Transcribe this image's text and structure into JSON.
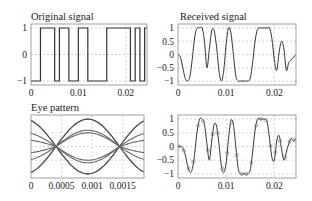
{
  "figure": {
    "width": 312,
    "height": 201,
    "background": "#ffffff",
    "axis_color": "#888888",
    "grid_color": "#bbbbbb",
    "line_color": "#333333",
    "eye_colors": [
      "#444444",
      "#666666",
      "#999999"
    ]
  },
  "chart_data": [
    {
      "id": "original",
      "type": "line",
      "title": "Original signal",
      "xlabel": "",
      "ylabel": "",
      "xlim": [
        0,
        0.0245
      ],
      "ylim": [
        -1.15,
        1.15
      ],
      "xticks": [
        0,
        0.01,
        0.02
      ],
      "xtick_labels": [
        "0",
        "0.01",
        "0.02"
      ],
      "yticks": [
        -1,
        0,
        1
      ],
      "ytick_labels": [
        "−1",
        "0",
        "1"
      ],
      "grid": true,
      "box": {
        "x": 31,
        "y": 24,
        "w": 116,
        "h": 61
      },
      "style": "step",
      "bit_period": 0.001,
      "bits": [
        -1,
        -1,
        1,
        1,
        1,
        -1,
        1,
        1,
        -1,
        -1,
        1,
        1,
        -1,
        -1,
        -1,
        -1,
        1,
        1,
        1,
        1,
        1,
        -1,
        1,
        -1,
        1
      ]
    },
    {
      "id": "received",
      "type": "line",
      "title": "Received signal",
      "xlabel": "",
      "ylabel": "",
      "xlim": [
        0,
        0.0245
      ],
      "ylim": [
        -1.15,
        1.15
      ],
      "xticks": [
        0,
        0.01,
        0.02
      ],
      "xtick_labels": [
        "0",
        "0.01",
        "0.02"
      ],
      "yticks": [
        -1,
        -0.5,
        0,
        0.5,
        1
      ],
      "ytick_labels": [
        "−1",
        "−0.5",
        "0",
        "0.5",
        "1"
      ],
      "grid": true,
      "box": {
        "x": 178,
        "y": 24,
        "w": 118,
        "h": 61
      },
      "style": "smooth",
      "x": [
        0,
        0.0005,
        0.001,
        0.0015,
        0.002,
        0.0025,
        0.003,
        0.0035,
        0.004,
        0.0045,
        0.005,
        0.0055,
        0.006,
        0.0065,
        0.007,
        0.0075,
        0.008,
        0.0085,
        0.009,
        0.0095,
        0.01,
        0.0105,
        0.011,
        0.0115,
        0.012,
        0.0125,
        0.013,
        0.0135,
        0.014,
        0.0145,
        0.015,
        0.0155,
        0.016,
        0.0165,
        0.017,
        0.0175,
        0.018,
        0.0185,
        0.019,
        0.0195,
        0.02,
        0.0205,
        0.021,
        0.0215,
        0.022,
        0.0225,
        0.023,
        0.0235,
        0.024,
        0.0245
      ],
      "y": [
        0,
        -0.1,
        -0.5,
        -0.9,
        -1,
        -0.8,
        -0.1,
        0.7,
        1,
        1,
        1,
        0.5,
        -0.5,
        0.2,
        0.9,
        0.9,
        0.3,
        -0.6,
        -1,
        -0.6,
        0.4,
        1,
        0.8,
        0,
        -0.8,
        -1,
        -1,
        -1,
        -1,
        -1,
        -0.9,
        -0.3,
        0.5,
        0.95,
        1,
        1,
        1,
        1,
        1,
        0.6,
        -0.2,
        -0.6,
        0.1,
        0.5,
        0.2,
        -0.6,
        -0.3,
        -0.2,
        -0.1,
        0
      ]
    },
    {
      "id": "eye",
      "type": "line",
      "title": "Eye pattern",
      "xlabel": "",
      "ylabel": "",
      "xlim": [
        0,
        0.00185
      ],
      "ylim": [
        -1.15,
        1.15
      ],
      "xticks": [
        0,
        0.0005,
        0.001,
        0.0015
      ],
      "xtick_labels": [
        "0",
        "0.0005",
        "0.001",
        "0.0015"
      ],
      "yticks": [],
      "ytick_labels": [],
      "grid": true,
      "box": {
        "x": 31,
        "y": 115,
        "w": 113,
        "h": 63
      },
      "crossings": [
        0.00041,
        0.00145
      ],
      "traces": [
        {
          "shape": "cos",
          "amp": 1.0,
          "phase": 0,
          "color_index": 2
        },
        {
          "shape": "cos",
          "amp": -1.0,
          "phase": 0,
          "color_index": 2
        },
        {
          "shape": "sin",
          "amp": 1.0,
          "phase": 0,
          "color_index": 0
        },
        {
          "shape": "sin",
          "amp": -1.0,
          "phase": 0,
          "color_index": 0
        },
        {
          "shape": "sin",
          "amp": 0.5,
          "phase": 0,
          "color_index": 1
        },
        {
          "shape": "sin",
          "amp": -0.5,
          "phase": 0,
          "color_index": 1
        },
        {
          "shape": "half",
          "amp": 0.85,
          "phase": 0,
          "color_index": 1
        },
        {
          "shape": "half",
          "amp": -0.85,
          "phase": 0,
          "color_index": 1
        }
      ]
    },
    {
      "id": "sampled",
      "type": "line",
      "title": "",
      "xlabel": "",
      "ylabel": "",
      "xlim": [
        0,
        0.0245
      ],
      "ylim": [
        -1.15,
        1.15
      ],
      "xticks": [
        0,
        0.01,
        0.02
      ],
      "xtick_labels": [
        "0",
        "0.01",
        "0.02"
      ],
      "yticks": [
        -1,
        -0.5,
        0,
        0.5,
        1
      ],
      "ytick_labels": [
        "−1",
        "−0.5",
        "0",
        "0.5",
        "1"
      ],
      "grid": true,
      "box": {
        "x": 178,
        "y": 115,
        "w": 118,
        "h": 63
      },
      "style": "smooth_with_markers",
      "x": [
        0,
        0.0005,
        0.001,
        0.0015,
        0.002,
        0.0025,
        0.003,
        0.0035,
        0.004,
        0.0045,
        0.005,
        0.0055,
        0.006,
        0.0065,
        0.007,
        0.0075,
        0.008,
        0.0085,
        0.009,
        0.0095,
        0.01,
        0.0105,
        0.011,
        0.0115,
        0.012,
        0.0125,
        0.013,
        0.0135,
        0.014,
        0.0145,
        0.015,
        0.0155,
        0.016,
        0.0165,
        0.017,
        0.0175,
        0.018,
        0.0185,
        0.019,
        0.0195,
        0.02,
        0.0205,
        0.021,
        0.0215,
        0.022,
        0.0225,
        0.023,
        0.0235,
        0.024,
        0.0245
      ],
      "y": [
        0,
        0,
        -0.05,
        -0.3,
        -0.7,
        -0.95,
        -0.8,
        -0.2,
        0.6,
        1,
        1,
        0.8,
        0.1,
        -0.5,
        0.2,
        0.8,
        0.75,
        0.1,
        -0.7,
        -0.95,
        -0.6,
        0.3,
        0.95,
        0.8,
        0,
        -0.8,
        -1,
        -1,
        -1,
        -1,
        -0.85,
        -0.2,
        0.6,
        1,
        1,
        1,
        1,
        0.9,
        0.3,
        -0.4,
        -0.5,
        0.2,
        0.4,
        -0.1,
        -0.5,
        -0.2,
        0.1,
        0.3,
        0.2,
        0.3
      ],
      "markers": [
        0.0002,
        0.0012,
        0.0022,
        0.0032,
        0.0042,
        0.0052,
        0.0062,
        0.0072,
        0.0082,
        0.0092,
        0.0102,
        0.0112,
        0.0122,
        0.0132,
        0.0142,
        0.0152,
        0.0162,
        0.0172,
        0.0182,
        0.0192,
        0.0202,
        0.0212,
        0.0222,
        0.0232,
        0.0242
      ]
    }
  ]
}
